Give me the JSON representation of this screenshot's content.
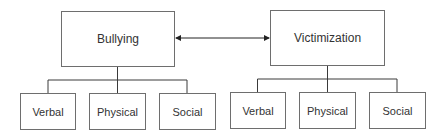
{
  "diagram": {
    "relation": "bidirectional",
    "left": {
      "label": "Bullying",
      "children": [
        "Verbal",
        "Physical",
        "Social"
      ]
    },
    "right": {
      "label": "Victimization",
      "children": [
        "Verbal",
        "Physical",
        "Social"
      ]
    },
    "colors": {
      "line": "#3a3a3a",
      "border": "#6e6e6e",
      "text": "#333333"
    }
  }
}
